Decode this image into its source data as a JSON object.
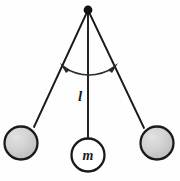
{
  "diagram": {
    "type": "physics-free-body-diagram",
    "background_color": "#fefefe",
    "stroke_color": "#1a1a1a",
    "labels": {
      "length": "l",
      "mass": "m"
    },
    "pivot": {
      "name": "pivot-point",
      "cx": 88,
      "cy": 10,
      "r": 4.2,
      "fill": "#111111"
    },
    "strings": [
      {
        "name": "string-left",
        "x1": 88,
        "y1": 10,
        "x2": 34,
        "y2": 127,
        "width": 1.9
      },
      {
        "name": "string-center",
        "x1": 88,
        "y1": 10,
        "x2": 88,
        "y2": 138,
        "width": 1.9
      },
      {
        "name": "string-right",
        "x1": 88,
        "y1": 10,
        "x2": 144,
        "y2": 128,
        "width": 1.9
      }
    ],
    "bobs": [
      {
        "name": "bob-left",
        "cx": 21,
        "cy": 143,
        "r": 17,
        "fill": "#cdcdcd",
        "stroke": "#1a1a1a",
        "stroke_width": 2.2,
        "shaded": true,
        "label": ""
      },
      {
        "name": "bob-center",
        "cx": 88,
        "cy": 155,
        "r": 17,
        "fill": "#ffffff",
        "stroke": "#1a1a1a",
        "stroke_width": 2.2,
        "shaded": false,
        "label": "m"
      },
      {
        "name": "bob-right",
        "cx": 157,
        "cy": 143,
        "r": 17,
        "fill": "#cdcdcd",
        "stroke": "#1a1a1a",
        "stroke_width": 2.2,
        "shaded": true,
        "label": ""
      }
    ],
    "swing_arc": {
      "name": "swing-arc",
      "path": "M 62 66 Q 88 82 116 66",
      "stroke": "#2b2b2b",
      "stroke_width": 1.4,
      "arrow_left": {
        "name": "arrow-left-head",
        "points": "62,66 69,70 66,72"
      },
      "arrow_right": {
        "name": "arrow-right-head",
        "points": "116,66 109,70 112,72"
      }
    },
    "length_label_position": {
      "x": 79,
      "y": 101
    },
    "mass_label_position": {
      "x": 88,
      "y": 160
    }
  }
}
